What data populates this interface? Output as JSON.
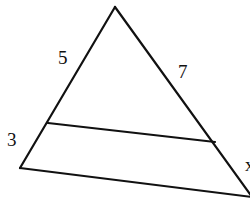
{
  "diagram": {
    "type": "triangle-with-parallel-segment",
    "labels": {
      "left_upper": "5",
      "right_upper": "7",
      "left_lower": "3",
      "right_lower": "x"
    },
    "points": {
      "apex": [
        115,
        7
      ],
      "bottom_left": [
        20,
        168
      ],
      "bottom_right": [
        252,
        197
      ],
      "inner_left": [
        48,
        123
      ],
      "inner_right": [
        215,
        142
      ]
    },
    "colors": {
      "stroke": "#111111",
      "background": "#ffffff"
    }
  }
}
